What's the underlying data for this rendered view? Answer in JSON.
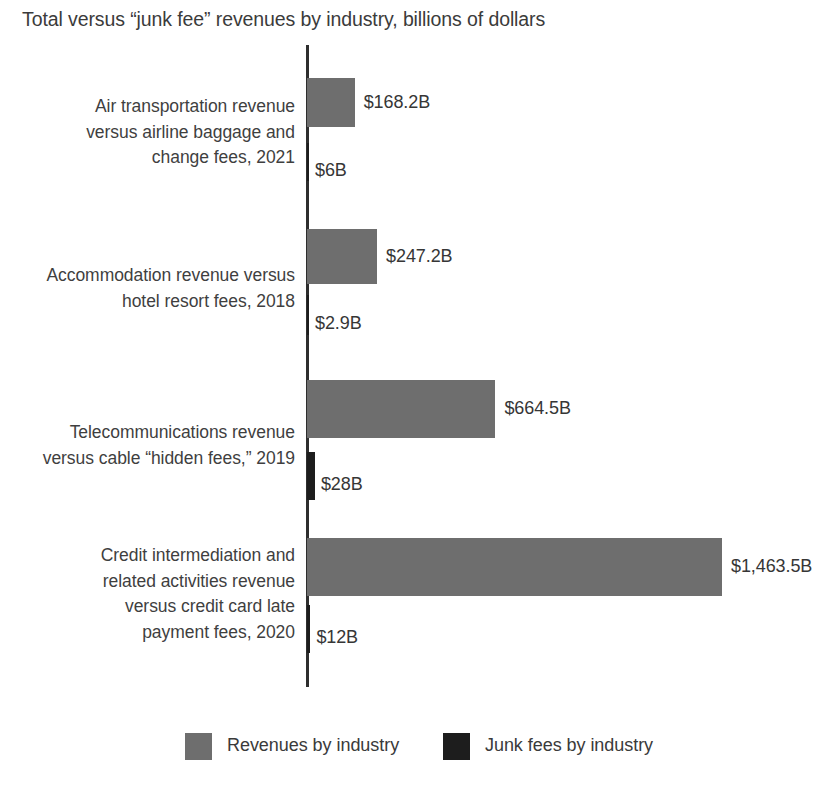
{
  "chart_data": {
    "type": "bar",
    "orientation": "horizontal",
    "title": "Total versus “junk fee” revenues by industry, billions of dollars",
    "xlabel": "",
    "ylabel": "",
    "units": "billions of dollars",
    "grid": false,
    "axis_range": [
      0,
      1463.5
    ],
    "legend_position": "bottom",
    "legend": [
      {
        "name": "Revenues by industry",
        "color": "#6e6e6e"
      },
      {
        "name": "Junk fees by industry",
        "color": "#1d1d1d"
      }
    ],
    "categories": [
      "Air transportation revenue versus airline baggage and change fees, 2021",
      "Accommodation revenue versus hotel resort fees, 2018",
      "Telecommunications revenue versus cable “hidden fees,” 2019",
      "Credit intermediation and related activities revenue versus credit card late payment fees, 2020"
    ],
    "category_lines": [
      [
        "Air transportation revenue",
        "versus airline baggage and",
        "change fees, 2021"
      ],
      [
        "Accommodation revenue versus",
        "hotel resort fees, 2018"
      ],
      [
        "Telecommunications revenue",
        "versus cable “hidden fees,” 2019"
      ],
      [
        "Credit intermediation and",
        "related activities revenue",
        "versus credit card late",
        "payment fees, 2020"
      ]
    ],
    "series": [
      {
        "name": "Revenues by industry",
        "color": "#6e6e6e",
        "values": [
          168.2,
          247.2,
          664.5,
          1463.5
        ],
        "labels": [
          "$168.2B",
          "$247.2B",
          "$664.5B",
          "$1,463.5B"
        ]
      },
      {
        "name": "Junk fees by industry",
        "color": "#1d1d1d",
        "values": [
          6,
          2.9,
          28,
          12
        ],
        "labels": [
          "$6B",
          "$2.9B",
          "$28B",
          "$12B"
        ]
      }
    ]
  },
  "layout": {
    "axis_x": 307,
    "px_per_billion": 0.2836,
    "groups": [
      {
        "total_top": 78,
        "total_h": 49,
        "fee_top": 143,
        "fee_h": 38
      },
      {
        "total_top": 229,
        "total_h": 55,
        "fee_top": 295,
        "fee_h": 40
      },
      {
        "total_top": 380,
        "total_h": 58,
        "fee_top": 452,
        "fee_h": 48
      },
      {
        "total_top": 538,
        "total_h": 58,
        "fee_top": 605,
        "fee_h": 48
      }
    ],
    "label_tops": [
      94,
      263,
      420,
      543
    ]
  }
}
